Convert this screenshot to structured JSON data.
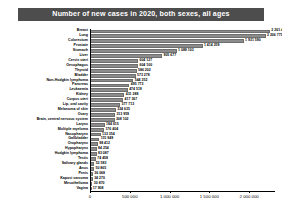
{
  "title": "Number of new cases in 2020, both sexes, all ages",
  "colors": {
    "title_banner_bg": "#4d4d4d",
    "title_text": "#ffffff",
    "bar_fill": "#8c8c8c",
    "bar_stroke": "#6e6e6e",
    "axis": "#000000",
    "page_bg": "#ffffff"
  },
  "chart_data": {
    "type": "bar",
    "orientation": "horizontal",
    "title": "Number of new cases in 2020, both sexes, all ages",
    "xlabel": "",
    "ylabel": "",
    "xlim": [
      0,
      2300000
    ],
    "grid": false,
    "legend": false,
    "xticks": [
      0,
      500000,
      1000000,
      1500000,
      2000000
    ],
    "xtick_labels": [
      "0",
      "500 000",
      "1 000 000",
      "1 500 000",
      "2 000 000"
    ],
    "categories": [
      "Breast",
      "Lung",
      "Colorectum",
      "Prostate",
      "Stomach",
      "Liver",
      "Cervix uteri",
      "Oesophagus",
      "Thyroid",
      "Bladder",
      "Non-Hodgkin lymphoma",
      "Pancreas",
      "Leukaemia",
      "Kidney",
      "Corpus uteri",
      "Lip, oral cavity",
      "Melanoma of skin",
      "Ovary",
      "Brain, central nervous system",
      "Larynx",
      "Multiple myeloma",
      "Nasopharynx",
      "Gallbladder",
      "Oropharynx",
      "Hypopharynx",
      "Hodgkin lymphoma",
      "Testis",
      "Salivary glands",
      "Anus",
      "Penis",
      "Kaposi sarcoma",
      "Mesothelioma",
      "Vagina"
    ],
    "values": [
      2261419,
      2206771,
      1931590,
      1414259,
      1089103,
      905677,
      604127,
      604100,
      586202,
      573278,
      544352,
      495773,
      474519,
      431288,
      417367,
      377713,
      324635,
      313959,
      308102,
      184615,
      176404,
      133354,
      115949,
      98412,
      84254,
      83087,
      74458,
      53583,
      50865,
      36068,
      34270,
      30870,
      17908
    ],
    "value_labels": [
      "2 261 419",
      "2 206 771",
      "1 931 590",
      "1 414 259",
      "1 089 103",
      "905 677",
      "604 127",
      "604 100",
      "586 202",
      "573 278",
      "544 352",
      "495 773",
      "474 519",
      "431 288",
      "417 367",
      "377 713",
      "324 635",
      "313 959",
      "308 102",
      "184 615",
      "176 404",
      "133 354",
      "115 949",
      "98 412",
      "84 254",
      "83 087",
      "74 458",
      "53 583",
      "50 865",
      "36 068",
      "34 270",
      "30 870",
      "17 908"
    ]
  }
}
